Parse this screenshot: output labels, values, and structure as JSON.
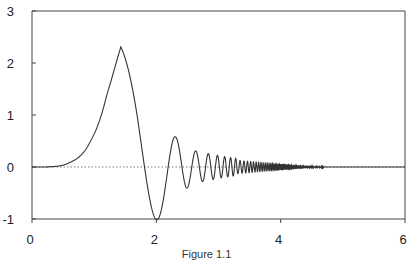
{
  "chart_data": {
    "type": "line",
    "title": "",
    "xlabel": "",
    "ylabel": "",
    "xlim": [
      0,
      6
    ],
    "ylim": [
      -1,
      3
    ],
    "x_ticks": [
      "0",
      "2",
      "4",
      "6"
    ],
    "y_ticks": [
      "3",
      "2",
      "1",
      "0",
      "-1"
    ],
    "grid": false,
    "legend": null,
    "reference_line": {
      "y": 0,
      "style": "dotted"
    },
    "series": [
      {
        "name": "damped chirp oscillation",
        "description": "Rises from 0, peaks ~2.3 at x~1.43, dips to -1 at x~2.0, then oscillates with increasing frequency and decaying amplitude, flattening to 0 by x~4.7",
        "x": [
          0,
          0.3,
          0.6,
          0.94,
          1.2,
          1.43,
          1.6,
          1.81,
          2.03,
          2.19,
          2.31,
          2.43,
          2.63,
          2.76,
          2.87,
          3.0,
          3.5,
          4.0,
          4.5,
          5.0,
          6.0
        ],
        "y": [
          0,
          0.01,
          0.12,
          0.5,
          1.45,
          2.31,
          1.9,
          0,
          -1.0,
          0,
          0.58,
          -0.6,
          0.31,
          -0.27,
          0.25,
          0.2,
          0.1,
          0.05,
          0.02,
          0,
          0
        ]
      }
    ],
    "caption": "Figure 1.1"
  },
  "colors": {
    "line": "#333333",
    "axis": "#444444",
    "zero_line": "#555555"
  }
}
